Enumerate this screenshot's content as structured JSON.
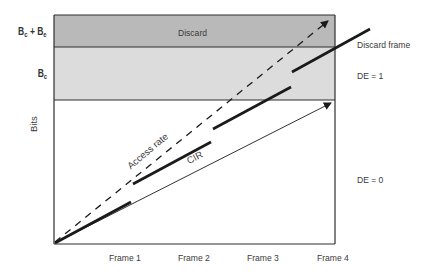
{
  "diagram": {
    "y_axis_label": "Bits",
    "y_levels": [
      {
        "id": "bc_be",
        "label_main1": "B",
        "label_sub1": "c",
        "label_plus": " + ",
        "label_main2": "B",
        "label_sub2": "e"
      },
      {
        "id": "bc",
        "label_main": "B",
        "label_sub": "c"
      }
    ],
    "bands": [
      {
        "name": "discard",
        "label": "Discard",
        "color": "#b9b9b9"
      },
      {
        "name": "de1",
        "label": "",
        "color": "#dcdcdc"
      },
      {
        "name": "de0",
        "label": "",
        "color": "#ffffff"
      }
    ],
    "x_ticks": [
      "Frame 1",
      "Frame 2",
      "Frame 3",
      "Frame 4"
    ],
    "lines": {
      "access_rate": {
        "label": "Access rate",
        "style": "dashed-arrow"
      },
      "cir": {
        "label": "CIR",
        "style": "thin-arrow"
      },
      "frames": {
        "style": "thick-segments",
        "count": 4
      }
    },
    "right_labels": {
      "discard_frame": "Discard frame",
      "de1": "DE = 1",
      "de0": "DE = 0"
    },
    "colors": {
      "outline": "#2e2e2e",
      "discard_band": "#b9b9b9",
      "de1_band": "#dcdcdc",
      "line": "#1a1a1a"
    }
  }
}
